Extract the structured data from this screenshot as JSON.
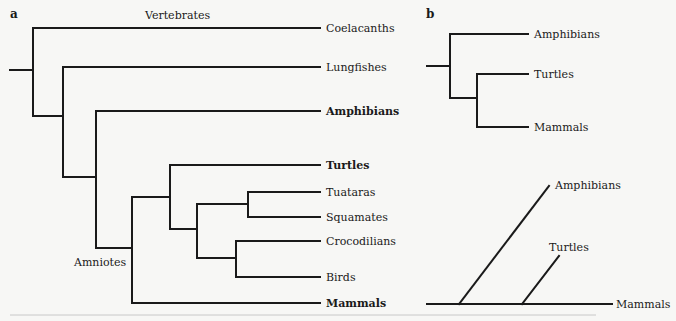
{
  "panel_a": {
    "label": "a",
    "clade_labels": {
      "vertebrates": "Vertebrates",
      "amniotes": "Amniotes"
    },
    "taxa": [
      {
        "name": "Coelacanths",
        "bold": false
      },
      {
        "name": "Lungfishes",
        "bold": false
      },
      {
        "name": "Amphibians",
        "bold": true
      },
      {
        "name": "Turtles",
        "bold": true
      },
      {
        "name": "Tuataras",
        "bold": false
      },
      {
        "name": "Squamates",
        "bold": false
      },
      {
        "name": "Crocodilians",
        "bold": false
      },
      {
        "name": "Birds",
        "bold": false
      },
      {
        "name": "Mammals",
        "bold": true
      }
    ],
    "topology": "(Coelacanths,(Lungfishes,(Amphibians,((Turtles,((Tuataras,Squamates),(Crocodilians,Birds))),Mammals))))"
  },
  "panel_b": {
    "label": "b",
    "rectangular_tree": {
      "taxa": [
        "Amphibians",
        "Turtles",
        "Mammals"
      ],
      "topology": "(Amphibians,(Turtles,Mammals))"
    },
    "diagonal_tree": {
      "taxa": [
        "Amphibians",
        "Turtles",
        "Mammals"
      ],
      "topology": "(Amphibians,(Turtles,Mammals))"
    }
  }
}
